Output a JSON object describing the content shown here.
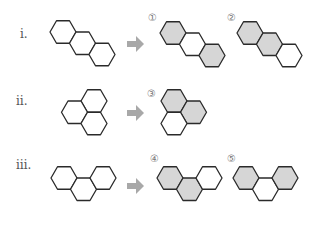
{
  "colors": {
    "shaded": "#d6d6d6",
    "unshaded": "#ffffff",
    "arrow": "#a8a8a8"
  },
  "rows": [
    {
      "label": "ⅰ.",
      "shape": "linear-three-ring",
      "options": [
        {
          "number": "①",
          "shaded_rings": [
            1,
            3
          ]
        },
        {
          "number": "②",
          "shaded_rings": [
            1,
            2
          ]
        }
      ]
    },
    {
      "label": "ⅱ.",
      "shape": "triangular-three-ring",
      "options": [
        {
          "number": "③",
          "shaded_rings": [
            1,
            2
          ]
        }
      ]
    },
    {
      "label": "ⅲ.",
      "shape": "angular-three-ring",
      "options": [
        {
          "number": "④",
          "shaded_rings": [
            1,
            2
          ]
        },
        {
          "number": "⑤",
          "shaded_rings": [
            1,
            3
          ]
        }
      ]
    }
  ]
}
